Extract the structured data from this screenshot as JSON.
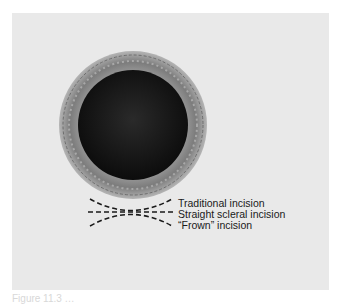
{
  "figure": {
    "background_color": "#e9e9e9",
    "eye": {
      "iris_color": "#8a8a8a",
      "pupil_color": "#141414",
      "center": [
        133,
        125
      ],
      "iris_radius": 74,
      "pupil_radius": 55
    },
    "incisions": [
      {
        "label": "Traditional incision",
        "shape": "smile"
      },
      {
        "label": "Straight scleral incision",
        "shape": "straight"
      },
      {
        "label": "“Frown” incision",
        "shape": "frown"
      }
    ],
    "caption": "Figure 11.3 …"
  }
}
